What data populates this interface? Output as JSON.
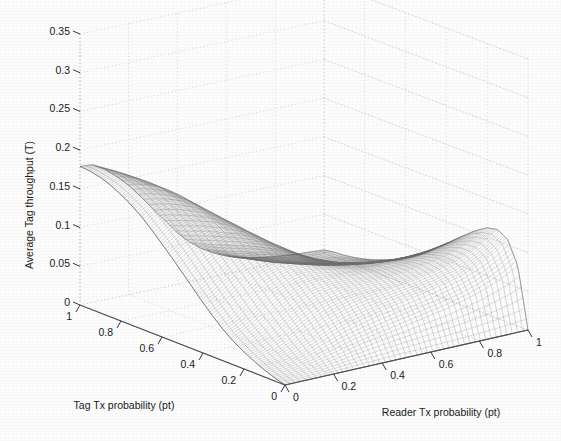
{
  "figure": {
    "background_color": "#fdfdfd",
    "ink_color": "#555555",
    "grid_color": "#c9c9c9"
  },
  "axes": {
    "z": {
      "title": "Average Tag throughput (T)",
      "ticks": [
        "0.35",
        "0.3",
        "0.25",
        "0.2",
        "0.15",
        "0.1",
        "0.05",
        "0"
      ],
      "tick_values": [
        0.35,
        0.3,
        0.25,
        0.2,
        0.15,
        0.1,
        0.05,
        0
      ],
      "range": [
        0,
        0.35
      ]
    },
    "x_left": {
      "title": "Tag Tx probability (pt)",
      "ticks": [
        "1",
        "0.8",
        "0.6",
        "0.4",
        "0.2",
        "0"
      ],
      "tick_values": [
        1,
        0.8,
        0.6,
        0.4,
        0.2,
        0
      ],
      "range": [
        0,
        1
      ]
    },
    "y_right": {
      "title": "Reader Tx probability (pt)",
      "ticks": [
        "0",
        "0.2",
        "0.4",
        "0.6",
        "0.8",
        "1"
      ],
      "tick_values": [
        0,
        0.2,
        0.4,
        0.6,
        0.8,
        1
      ],
      "range": [
        0,
        1
      ]
    }
  },
  "chart_data": {
    "type": "surface",
    "title": "",
    "subtitle": "",
    "xlabel": "Tag Tx probability (pt)",
    "ylabel": "Reader Tx probability (pt)",
    "zlabel": "Average Tag throughput (T)",
    "xlim": [
      0,
      1
    ],
    "ylim": [
      0,
      1
    ],
    "zlim": [
      0,
      0.35
    ],
    "xticks": [
      0,
      0.2,
      0.4,
      0.6,
      0.8,
      1
    ],
    "yticks": [
      0,
      0.2,
      0.4,
      0.6,
      0.8,
      1
    ],
    "zticks": [
      0,
      0.05,
      0.1,
      0.15,
      0.2,
      0.25,
      0.3,
      0.35
    ],
    "grid": true,
    "legend": null,
    "style": "wireframe-mesh",
    "shading": "grayscale line mesh, no fill",
    "peak_value": 0.18,
    "peak_location": {
      "tag_tx_probability": 0.15,
      "reader_tx_probability": 0.75
    },
    "secondary_ridge_value": 0.115,
    "secondary_ridge_location": {
      "tag_tx_probability": 0.8,
      "reader_tx_probability": 0.25
    },
    "x": [
      0,
      0.05,
      0.1,
      0.15,
      0.2,
      0.25,
      0.3,
      0.35,
      0.4,
      0.45,
      0.5,
      0.55,
      0.6,
      0.65,
      0.7,
      0.75,
      0.8,
      0.85,
      0.9,
      0.95,
      1
    ],
    "y": [
      0,
      0.05,
      0.1,
      0.15,
      0.2,
      0.25,
      0.3,
      0.35,
      0.4,
      0.45,
      0.5,
      0.55,
      0.6,
      0.65,
      0.7,
      0.75,
      0.8,
      0.85,
      0.9,
      0.95,
      1
    ],
    "z_description": "Throughput rises from 0 along both zero-probability edges, forms a broad low plateau near T=0.10-0.12 for large tag Tx probability and small reader Tx probability, dips in the mid region, and rises to a dome-shaped maximum of about T=0.18 at small tag Tx probability and large reader Tx probability, then falls back toward 0 at the far corner.",
    "z": [
      [
        0.0,
        0.004,
        0.009,
        0.015,
        0.022,
        0.03,
        0.04,
        0.052,
        0.065,
        0.079,
        0.093,
        0.107,
        0.12,
        0.133,
        0.145,
        0.155,
        0.163,
        0.17,
        0.175,
        0.178,
        0.179
      ],
      [
        0.0,
        0.005,
        0.011,
        0.018,
        0.026,
        0.036,
        0.047,
        0.06,
        0.074,
        0.089,
        0.104,
        0.118,
        0.131,
        0.143,
        0.154,
        0.163,
        0.17,
        0.175,
        0.178,
        0.179,
        0.178
      ],
      [
        0.0,
        0.007,
        0.014,
        0.023,
        0.033,
        0.044,
        0.057,
        0.071,
        0.085,
        0.099,
        0.113,
        0.126,
        0.138,
        0.148,
        0.157,
        0.164,
        0.169,
        0.172,
        0.173,
        0.172,
        0.169
      ],
      [
        0.0,
        0.009,
        0.019,
        0.03,
        0.042,
        0.055,
        0.068,
        0.082,
        0.095,
        0.108,
        0.12,
        0.131,
        0.141,
        0.149,
        0.156,
        0.161,
        0.164,
        0.165,
        0.164,
        0.161,
        0.156
      ],
      [
        0.0,
        0.012,
        0.025,
        0.038,
        0.052,
        0.065,
        0.078,
        0.091,
        0.103,
        0.114,
        0.124,
        0.133,
        0.14,
        0.146,
        0.151,
        0.154,
        0.155,
        0.154,
        0.151,
        0.147,
        0.141
      ],
      [
        0.0,
        0.015,
        0.031,
        0.046,
        0.06,
        0.073,
        0.085,
        0.096,
        0.106,
        0.115,
        0.123,
        0.129,
        0.134,
        0.138,
        0.14,
        0.141,
        0.14,
        0.138,
        0.134,
        0.129,
        0.123
      ],
      [
        0.0,
        0.019,
        0.037,
        0.053,
        0.067,
        0.079,
        0.09,
        0.099,
        0.107,
        0.113,
        0.118,
        0.122,
        0.125,
        0.126,
        0.126,
        0.125,
        0.123,
        0.119,
        0.115,
        0.11,
        0.104
      ],
      [
        0.0,
        0.022,
        0.042,
        0.058,
        0.071,
        0.082,
        0.091,
        0.098,
        0.103,
        0.107,
        0.11,
        0.112,
        0.112,
        0.112,
        0.11,
        0.108,
        0.104,
        0.1,
        0.095,
        0.09,
        0.085
      ],
      [
        0.0,
        0.025,
        0.046,
        0.062,
        0.074,
        0.083,
        0.09,
        0.094,
        0.097,
        0.099,
        0.1,
        0.099,
        0.098,
        0.096,
        0.093,
        0.089,
        0.085,
        0.081,
        0.076,
        0.071,
        0.066
      ],
      [
        0.0,
        0.028,
        0.05,
        0.065,
        0.075,
        0.082,
        0.087,
        0.089,
        0.09,
        0.09,
        0.089,
        0.087,
        0.084,
        0.081,
        0.077,
        0.073,
        0.068,
        0.064,
        0.059,
        0.055,
        0.051
      ],
      [
        0.0,
        0.031,
        0.053,
        0.067,
        0.076,
        0.081,
        0.084,
        0.084,
        0.084,
        0.082,
        0.08,
        0.077,
        0.073,
        0.069,
        0.065,
        0.06,
        0.056,
        0.051,
        0.047,
        0.043,
        0.039
      ],
      [
        0.0,
        0.034,
        0.056,
        0.069,
        0.076,
        0.08,
        0.081,
        0.08,
        0.078,
        0.076,
        0.072,
        0.068,
        0.064,
        0.059,
        0.055,
        0.05,
        0.046,
        0.041,
        0.037,
        0.034,
        0.03
      ],
      [
        0.0,
        0.037,
        0.059,
        0.071,
        0.077,
        0.079,
        0.079,
        0.077,
        0.074,
        0.07,
        0.066,
        0.061,
        0.056,
        0.051,
        0.046,
        0.042,
        0.037,
        0.033,
        0.03,
        0.026,
        0.023
      ],
      [
        0.0,
        0.04,
        0.062,
        0.073,
        0.078,
        0.079,
        0.078,
        0.075,
        0.071,
        0.066,
        0.061,
        0.056,
        0.05,
        0.045,
        0.04,
        0.035,
        0.031,
        0.027,
        0.024,
        0.021,
        0.018
      ],
      [
        0.0,
        0.043,
        0.065,
        0.076,
        0.08,
        0.08,
        0.078,
        0.074,
        0.069,
        0.063,
        0.057,
        0.051,
        0.046,
        0.04,
        0.035,
        0.031,
        0.027,
        0.023,
        0.02,
        0.017,
        0.014
      ],
      [
        0.0,
        0.047,
        0.069,
        0.079,
        0.082,
        0.081,
        0.078,
        0.073,
        0.067,
        0.061,
        0.054,
        0.048,
        0.042,
        0.036,
        0.031,
        0.027,
        0.023,
        0.019,
        0.016,
        0.014,
        0.011
      ],
      [
        0.0,
        0.051,
        0.073,
        0.083,
        0.085,
        0.083,
        0.079,
        0.073,
        0.066,
        0.059,
        0.052,
        0.045,
        0.039,
        0.033,
        0.028,
        0.024,
        0.02,
        0.016,
        0.013,
        0.011,
        0.009
      ],
      [
        0.0,
        0.056,
        0.079,
        0.088,
        0.089,
        0.086,
        0.081,
        0.074,
        0.066,
        0.058,
        0.05,
        0.043,
        0.037,
        0.031,
        0.026,
        0.021,
        0.017,
        0.014,
        0.011,
        0.009,
        0.007
      ],
      [
        0.0,
        0.062,
        0.086,
        0.095,
        0.095,
        0.09,
        0.084,
        0.076,
        0.067,
        0.058,
        0.05,
        0.042,
        0.035,
        0.029,
        0.024,
        0.019,
        0.015,
        0.012,
        0.01,
        0.008,
        0.006
      ],
      [
        0.0,
        0.069,
        0.095,
        0.104,
        0.102,
        0.096,
        0.088,
        0.079,
        0.069,
        0.059,
        0.05,
        0.041,
        0.034,
        0.028,
        0.022,
        0.018,
        0.014,
        0.011,
        0.008,
        0.007,
        0.005
      ],
      [
        0.0,
        0.078,
        0.107,
        0.115,
        0.112,
        0.104,
        0.094,
        0.083,
        0.072,
        0.061,
        0.05,
        0.041,
        0.033,
        0.026,
        0.021,
        0.016,
        0.012,
        0.009,
        0.007,
        0.006,
        0.004
      ]
    ]
  }
}
